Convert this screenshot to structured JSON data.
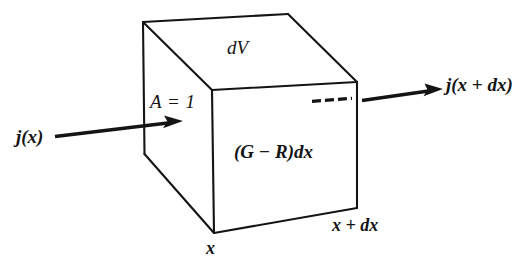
{
  "figure": {
    "width": 532,
    "height": 263,
    "background_color": "#ffffff",
    "line_color": "#141414",
    "line_width": 2
  },
  "labels": {
    "volume_element": "dV",
    "area": "A = 1",
    "generation_recombination": "(G − R)dx",
    "current_in": "j(x)",
    "current_out": "j(x + dx)",
    "position_left": "x",
    "position_right": "x + dx"
  },
  "geometry": {
    "box": {
      "front_face": {
        "top_left": [
          212,
          90
        ],
        "top_right": [
          357,
          82
        ],
        "bottom_right": [
          357,
          208
        ],
        "bottom_left": [
          214,
          233
        ]
      },
      "back_top_left": [
        143,
        22
      ],
      "back_top_right": [
        288,
        14
      ],
      "back_bottom_left": [
        144,
        154
      ]
    },
    "arrow_in": {
      "start": [
        55,
        136
      ],
      "end": [
        182,
        121
      ]
    },
    "arrow_out": {
      "start": [
        362,
        100
      ],
      "end": [
        441,
        89
      ]
    },
    "dashed_segment": {
      "start": [
        312,
        101
      ],
      "end": [
        353,
        98
      ],
      "dash_count": 4
    }
  }
}
